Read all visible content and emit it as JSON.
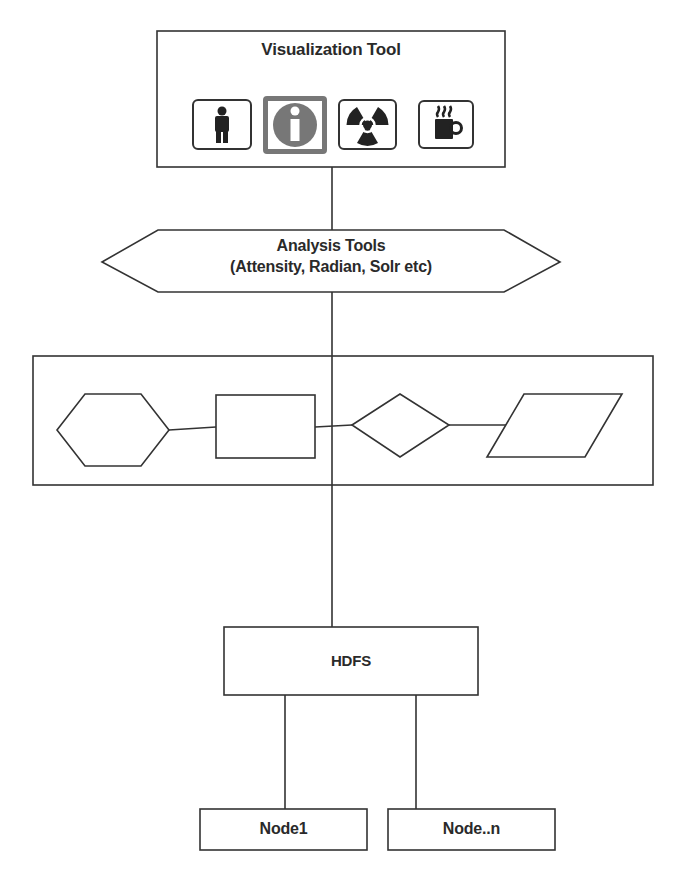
{
  "visualization_tool": {
    "title": "Visualization Tool",
    "icons": [
      {
        "name": "person-icon",
        "selected": false
      },
      {
        "name": "info-icon",
        "selected": true
      },
      {
        "name": "radiation-icon",
        "selected": false
      },
      {
        "name": "coffee-mug-icon",
        "selected": false
      }
    ]
  },
  "analysis_tools": {
    "line1": "Analysis Tools",
    "line2": "(Attensity, Radian, Solr etc)"
  },
  "process_flow": {
    "shapes": [
      "hexagon",
      "rectangle",
      "diamond",
      "parallelogram"
    ]
  },
  "hdfs": {
    "label": "HDFS"
  },
  "nodes": [
    {
      "label": "Node1"
    },
    {
      "label": "Node..n"
    }
  ],
  "colors": {
    "stroke": "#333333",
    "selected_icon": "#777777",
    "background": "#ffffff"
  }
}
